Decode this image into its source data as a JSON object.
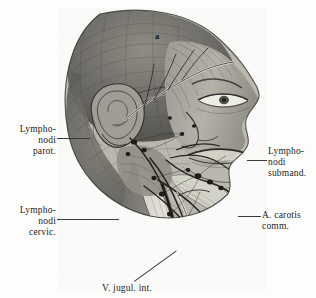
{
  "plate": {
    "type": "anatomical-illustration",
    "subject": "Lateral dissection of head and neck showing lymph nodes and great vessels",
    "style": "grayscale halftone engraving",
    "background_color": "#fdfdfc",
    "ink_color": "#1c1c1c"
  },
  "markers": {
    "scalp": "a"
  },
  "labels": {
    "parotid": "Lympho-\nnodi\nparot.",
    "cervical": "Lympho-\nnodi\ncervic.",
    "submandibular": "Lympho-\nnodi\nsubmand.",
    "carotid": "A. carotis\ncomm.",
    "jugular": "V. jugul. int."
  }
}
